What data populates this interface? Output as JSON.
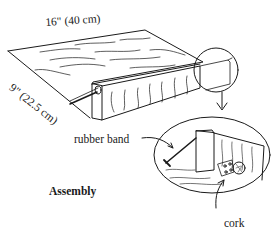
{
  "figure": {
    "title": "Assembly",
    "dimensions": {
      "length": "16\" (40 cm)",
      "width": "9\" (22.5 cm)"
    },
    "callouts": {
      "rubber_band": "rubber band",
      "cork": "cork"
    },
    "colors": {
      "ink": "#1a1a1a",
      "background": "#ffffff"
    }
  }
}
